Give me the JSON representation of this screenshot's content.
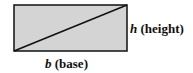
{
  "diagram": {
    "type": "rectangle-with-diagonal",
    "rect": {
      "x": 14,
      "y": 5,
      "width": 113,
      "height": 46
    },
    "diagonal": {
      "from": "bottom-left",
      "to": "top-right"
    },
    "colors": {
      "fill": "#d4d4d4",
      "stroke": "#111111",
      "text": "#111111"
    }
  },
  "labels": {
    "height": {
      "var": "h",
      "text": " (height)"
    },
    "base": {
      "var": "b",
      "text": " (base)"
    }
  }
}
